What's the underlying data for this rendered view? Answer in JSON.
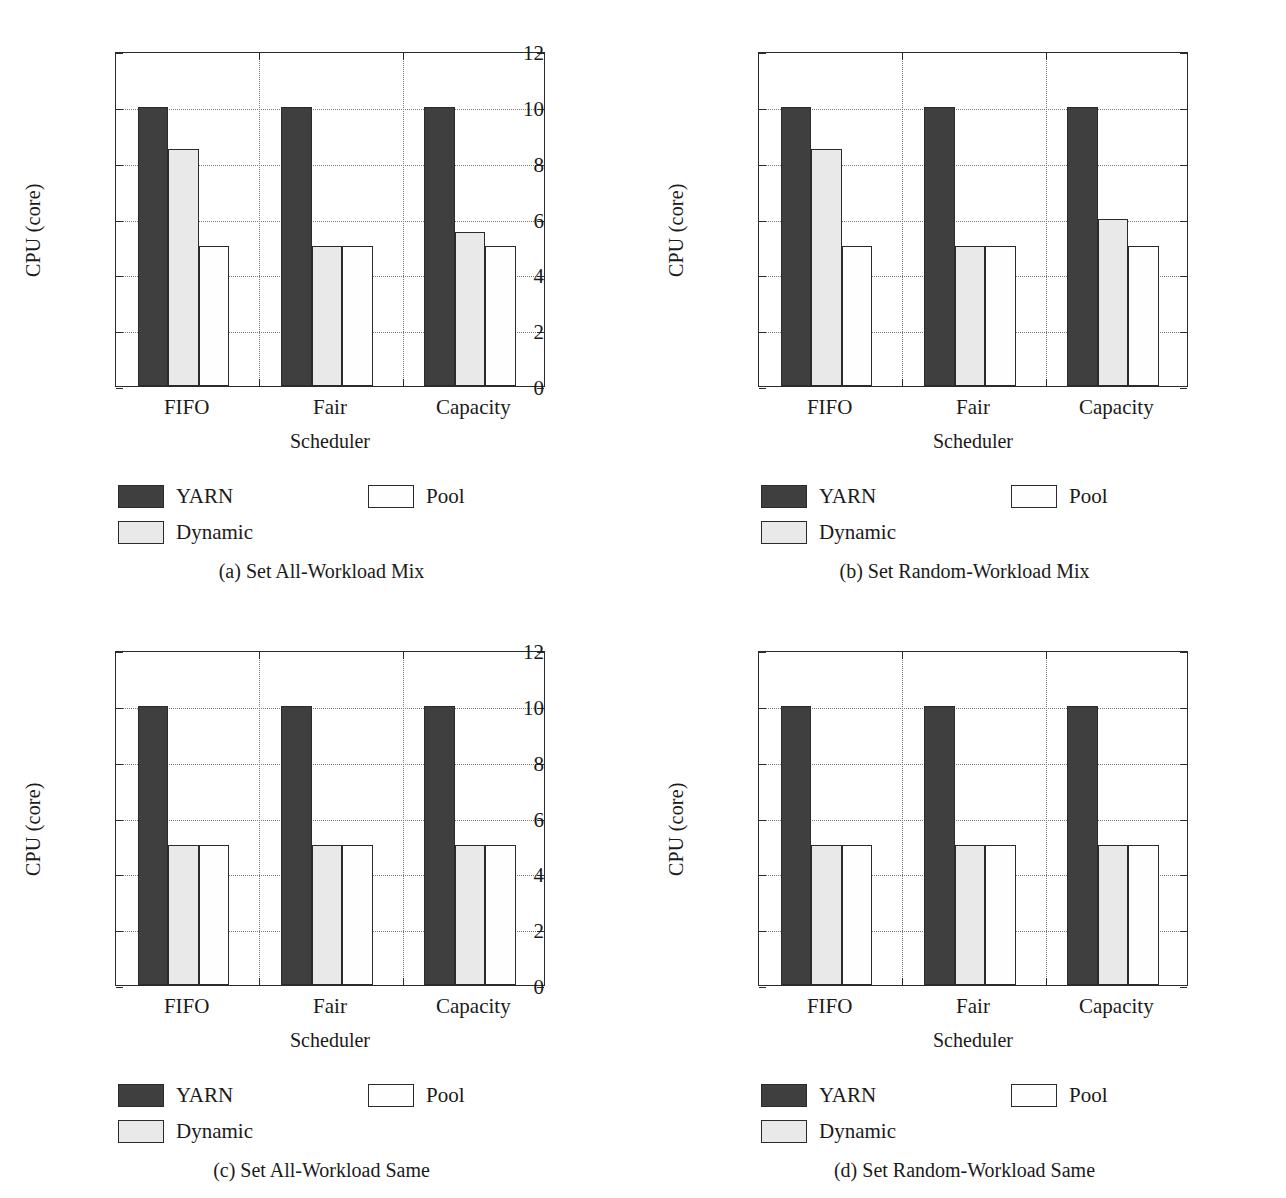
{
  "figure": {
    "axis_color": "#2b2b2b",
    "grid_color": "#7a7a7a",
    "series_colors": {
      "YARN": "#3f3f3f",
      "Dynamic": "#e9e9e9",
      "Pool": "#fefefe"
    }
  },
  "chart_data": [
    {
      "type": "bar",
      "panel": "a",
      "caption": "(a)  Set All-Workload Mix",
      "title": "",
      "xlabel": "Scheduler",
      "ylabel": "CPU (core)",
      "categories": [
        "FIFO",
        "Fair",
        "Capacity"
      ],
      "series": [
        {
          "name": "YARN",
          "values": [
            10,
            10,
            10
          ]
        },
        {
          "name": "Dynamic",
          "values": [
            8.5,
            5,
            5.5
          ]
        },
        {
          "name": "Pool",
          "values": [
            5,
            5,
            5
          ]
        }
      ],
      "ylim": [
        0,
        12
      ],
      "yticks": [
        0,
        2,
        4,
        6,
        8,
        10,
        12
      ],
      "grid": true,
      "legend_position": "below-plot"
    },
    {
      "type": "bar",
      "panel": "b",
      "caption": "(b)  Set Random-Workload Mix",
      "title": "",
      "xlabel": "Scheduler",
      "ylabel": "CPU (core)",
      "categories": [
        "FIFO",
        "Fair",
        "Capacity"
      ],
      "series": [
        {
          "name": "YARN",
          "values": [
            10,
            10,
            10
          ]
        },
        {
          "name": "Dynamic",
          "values": [
            8.5,
            5,
            6
          ]
        },
        {
          "name": "Pool",
          "values": [
            5,
            5,
            5
          ]
        }
      ],
      "ylim": [
        0,
        12
      ],
      "yticks": [
        0,
        2,
        4,
        6,
        8,
        10,
        12
      ],
      "grid": true,
      "legend_position": "below-plot"
    },
    {
      "type": "bar",
      "panel": "c",
      "caption": "(c)  Set All-Workload Same",
      "title": "",
      "xlabel": "Scheduler",
      "ylabel": "CPU (core)",
      "categories": [
        "FIFO",
        "Fair",
        "Capacity"
      ],
      "series": [
        {
          "name": "YARN",
          "values": [
            10,
            10,
            10
          ]
        },
        {
          "name": "Dynamic",
          "values": [
            5,
            5,
            5
          ]
        },
        {
          "name": "Pool",
          "values": [
            5,
            5,
            5
          ]
        }
      ],
      "ylim": [
        0,
        12
      ],
      "yticks": [
        0,
        2,
        4,
        6,
        8,
        10,
        12
      ],
      "grid": true,
      "legend_position": "below-plot"
    },
    {
      "type": "bar",
      "panel": "d",
      "caption": "(d)  Set Random-Workload Same",
      "title": "",
      "xlabel": "Scheduler",
      "ylabel": "CPU (core)",
      "categories": [
        "FIFO",
        "Fair",
        "Capacity"
      ],
      "series": [
        {
          "name": "YARN",
          "values": [
            10,
            10,
            10
          ]
        },
        {
          "name": "Dynamic",
          "values": [
            5,
            5,
            5
          ]
        },
        {
          "name": "Pool",
          "values": [
            5,
            5,
            5
          ]
        }
      ],
      "ylim": [
        0,
        12
      ],
      "yticks": [
        0,
        2,
        4,
        6,
        8,
        10,
        12
      ],
      "grid": true,
      "legend_position": "below-plot"
    }
  ]
}
